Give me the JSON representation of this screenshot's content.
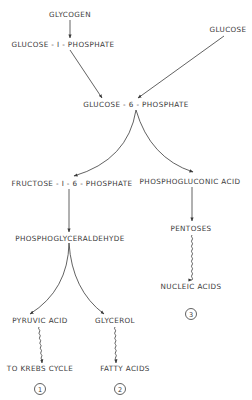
{
  "diagram": {
    "nodes": {
      "glycogen": "GLYCOGEN",
      "glucose_1_phosphate": "GLUCOSE - I - PHOSPHATE",
      "glucose": "GLUCOSE",
      "glucose_6_phosphate": "GLUCOSE - 6 - PHOSPHATE",
      "phosphogluconic_acid": "PHOSPHOGLUCONIC  ACID",
      "fructose_1_6_phosphate": "FRUCTOSE - I - 6 - PHOSPHATE",
      "pentoses": "PENTOSES",
      "phosphoglyceraldehyde": "PHOSPHOGLYCERALDEHYDE",
      "nucleic_acids": "NUCLEIC  ACIDS",
      "pyruvic_acid": "PYRUVIC  ACID",
      "glycerol": "GLYCEROL",
      "to_krebs_cycle": "TO  KREBS  CYCLE",
      "fatty_acids": "FATTY  ACIDS"
    },
    "pathway_markers": {
      "one": "1",
      "two": "2",
      "three": "3"
    },
    "edges": [
      {
        "from": "glycogen",
        "to": "glucose_1_phosphate",
        "style": "straight"
      },
      {
        "from": "glucose_1_phosphate",
        "to": "glucose_6_phosphate",
        "style": "straight"
      },
      {
        "from": "glucose",
        "to": "glucose_6_phosphate",
        "style": "straight"
      },
      {
        "from": "glucose_6_phosphate",
        "to": "fructose_1_6_phosphate",
        "style": "curved"
      },
      {
        "from": "glucose_6_phosphate",
        "to": "phosphogluconic_acid",
        "style": "curved"
      },
      {
        "from": "phosphogluconic_acid",
        "to": "pentoses",
        "style": "straight"
      },
      {
        "from": "fructose_1_6_phosphate",
        "to": "phosphoglyceraldehyde",
        "style": "straight"
      },
      {
        "from": "pentoses",
        "to": "nucleic_acids",
        "style": "wavy"
      },
      {
        "from": "phosphoglyceraldehyde",
        "to": "pyruvic_acid",
        "style": "curved"
      },
      {
        "from": "phosphoglyceraldehyde",
        "to": "glycerol",
        "style": "curved"
      },
      {
        "from": "pyruvic_acid",
        "to": "to_krebs_cycle",
        "style": "wavy"
      },
      {
        "from": "glycerol",
        "to": "fatty_acids",
        "style": "wavy"
      }
    ]
  }
}
